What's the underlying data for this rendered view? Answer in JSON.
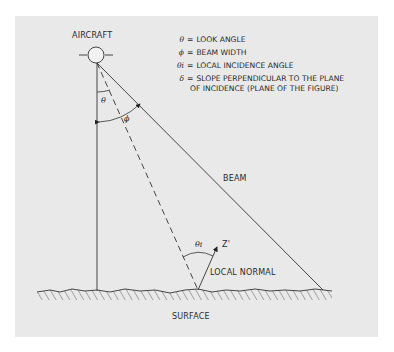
{
  "figure": {
    "labels": {
      "aircraft": "AIRCRAFT",
      "beam": "BEAM",
      "local_normal": "LOCAL NORMAL",
      "surface": "SURFACE",
      "z_prime": "Z'",
      "theta": "θ",
      "phi": "ϕ",
      "theta_i": "θi"
    },
    "legend": [
      {
        "symbol": "θ",
        "text": "LOOK ANGLE"
      },
      {
        "symbol": "ϕ",
        "text": "BEAM WIDTH"
      },
      {
        "symbol": "θi",
        "text": "LOCAL INCIDENCE ANGLE"
      },
      {
        "symbol": "δ",
        "text": "SLOPE PERPENDICULAR TO THE PLANE",
        "continuation": "OF INCIDENCE (PLANE OF THE FIGURE)"
      }
    ],
    "equals": "="
  }
}
